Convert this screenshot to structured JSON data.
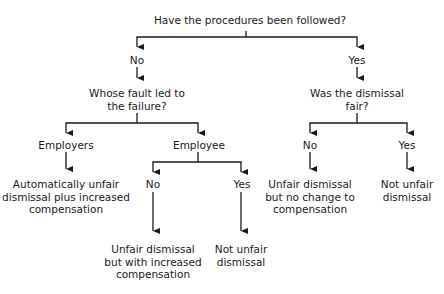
{
  "diagram": {
    "type": "decision-tree",
    "title": "Have the procedures been followed?",
    "nodes": {
      "root": {
        "label": "Have the procedures been followed?"
      },
      "root_no": {
        "label": "No"
      },
      "root_yes": {
        "label": "Yes"
      },
      "fault_q": {
        "line1": "Whose fault led to",
        "line2": "the failure?"
      },
      "fair_q": {
        "line1": "Was the dismissal",
        "line2": "fair?"
      },
      "employers": {
        "label": "Employers"
      },
      "employee": {
        "label": "Employee"
      },
      "employers_outcome": {
        "line1": "Automatically unfair",
        "line2": "dismissal plus increased",
        "line3": "compensation"
      },
      "employee_no": {
        "label": "No"
      },
      "employee_yes": {
        "label": "Yes"
      },
      "employee_no_outcome": {
        "line1": "Unfair dismissal",
        "line2": "but with increased",
        "line3": "compensation"
      },
      "employee_yes_outcome": {
        "line1": "Not unfair",
        "line2": "dismissal"
      },
      "fair_no": {
        "label": "No"
      },
      "fair_yes": {
        "label": "Yes"
      },
      "fair_no_outcome": {
        "line1": "Unfair dismissal",
        "line2": "but no change to",
        "line3": "compensation"
      },
      "fair_yes_outcome": {
        "line1": "Not unfair",
        "line2": "dismissal"
      }
    },
    "edges": [
      [
        "root",
        "root_no"
      ],
      [
        "root",
        "root_yes"
      ],
      [
        "root_no",
        "fault_q"
      ],
      [
        "root_yes",
        "fair_q"
      ],
      [
        "fault_q",
        "employers"
      ],
      [
        "fault_q",
        "employee"
      ],
      [
        "employers",
        "employers_outcome"
      ],
      [
        "employee",
        "employee_no"
      ],
      [
        "employee",
        "employee_yes"
      ],
      [
        "employee_no",
        "employee_no_outcome"
      ],
      [
        "employee_yes",
        "employee_yes_outcome"
      ],
      [
        "fair_q",
        "fair_no"
      ],
      [
        "fair_q",
        "fair_yes"
      ],
      [
        "fair_no",
        "fair_no_outcome"
      ],
      [
        "fair_yes",
        "fair_yes_outcome"
      ]
    ]
  }
}
